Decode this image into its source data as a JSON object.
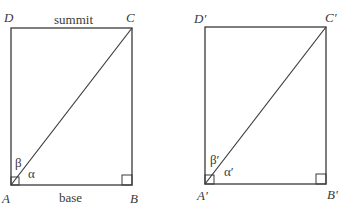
{
  "figures": [
    {
      "name": "original",
      "rect": {
        "x1": 11,
        "y1": 28,
        "x2": 132,
        "y2": 185
      },
      "vertices": {
        "A": "A",
        "B": "B",
        "C": "C",
        "D": "D"
      },
      "angles": {
        "alpha": "α",
        "beta": "β"
      },
      "side_labels": {
        "top": "summit",
        "bottom": "base"
      }
    },
    {
      "name": "primed",
      "rect": {
        "x1": 205,
        "y1": 27,
        "x2": 326,
        "y2": 184
      },
      "vertices": {
        "A": "A′",
        "B": "B′",
        "C": "C′",
        "D": "D′"
      },
      "angles": {
        "alpha": "α′",
        "beta": "β′"
      },
      "side_labels": {
        "top": "",
        "bottom": ""
      }
    }
  ],
  "colors": {
    "line": "#3a3a3a",
    "background": "#ffffff"
  }
}
